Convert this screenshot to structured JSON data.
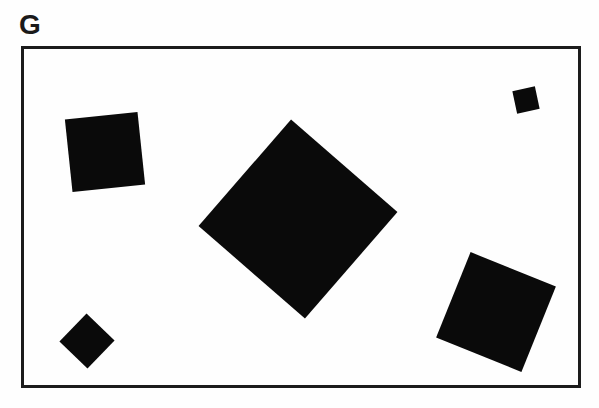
{
  "figure": {
    "label": "G",
    "background_color": "#fefefe",
    "shape_color": "#0a0a0a",
    "border_color": "#1c1c1c",
    "frame": {
      "x": 21,
      "y": 46,
      "width": 560,
      "height": 342,
      "border_width": 3
    },
    "squares": [
      {
        "id": "upper-left",
        "cx": 105,
        "cy": 152,
        "side": 73,
        "rotation_deg": -6
      },
      {
        "id": "center-large",
        "cx": 298,
        "cy": 219,
        "side": 141,
        "rotation_deg": 41
      },
      {
        "id": "top-right-small",
        "cx": 526,
        "cy": 100,
        "side": 23,
        "rotation_deg": -12
      },
      {
        "id": "bottom-right",
        "cx": 496,
        "cy": 312,
        "side": 92,
        "rotation_deg": 22
      },
      {
        "id": "bottom-left-small",
        "cx": 87,
        "cy": 341,
        "side": 39,
        "rotation_deg": 44
      }
    ]
  }
}
